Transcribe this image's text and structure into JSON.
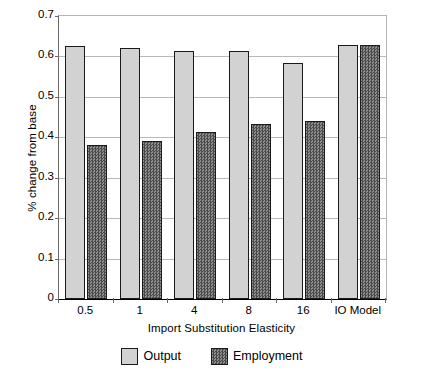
{
  "chart_data": {
    "type": "bar",
    "title": "",
    "xlabel": "Import Substitution Elasticity",
    "ylabel": "% change from base",
    "categories": [
      "0.5",
      "1",
      "4",
      "8",
      "16",
      "IO Model"
    ],
    "series": [
      {
        "name": "Output",
        "color": "#d2d2d2",
        "values": [
          0.625,
          0.62,
          0.614,
          0.613,
          0.585,
          0.628
        ]
      },
      {
        "name": "Employment",
        "color": "#5a5a5a",
        "values": [
          0.38,
          0.39,
          0.413,
          0.433,
          0.441,
          0.628
        ]
      }
    ],
    "ylim": [
      0,
      0.7
    ],
    "ytick_values": [
      0,
      0.1,
      0.2,
      0.3,
      0.4,
      0.5,
      0.6,
      0.7
    ],
    "ytick_labels": [
      "0",
      "0.1",
      "0.2",
      "0.3",
      "0.4",
      "0.5",
      "0.6",
      "0.7"
    ],
    "grid": true,
    "legend_position": "bottom"
  },
  "legend": {
    "entries": [
      {
        "label": "Output"
      },
      {
        "label": "Employment"
      }
    ]
  }
}
